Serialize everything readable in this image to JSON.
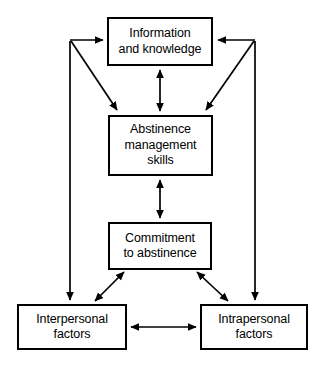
{
  "diagram": {
    "type": "flowchart",
    "title": "",
    "background_color": "#ffffff",
    "line_color": "#000000",
    "text_color": "#000000",
    "nodes": [
      {
        "id": "information",
        "label": "Information\nand knowledge",
        "line1": "Information",
        "line2": "and knowledge"
      },
      {
        "id": "abstinence",
        "label": "Abstinence\nmanagement\nskills",
        "line1": "Abstinence",
        "line2": "management",
        "line3": "skills"
      },
      {
        "id": "commitment",
        "label": "Commitment\nto abstinence",
        "line1": "Commitment",
        "line2": "to abstinence"
      },
      {
        "id": "interpersonal",
        "label": "Interpersonal\nfactors",
        "line1": "Interpersonal",
        "line2": "factors"
      },
      {
        "id": "intrapersonal",
        "label": "Intrapersonal\nfactors",
        "line1": "Intrapersonal",
        "line2": "factors"
      }
    ],
    "edges": [
      {
        "id": "information-abstinence",
        "from": "information",
        "to": "abstinence",
        "direction": "bidirectional",
        "style": "vertical"
      },
      {
        "id": "abstinence-commitment",
        "from": "abstinence",
        "to": "commitment",
        "direction": "bidirectional",
        "style": "vertical"
      },
      {
        "id": "commitment-interpersonal",
        "from": "commitment",
        "to": "interpersonal",
        "direction": "bidirectional",
        "style": "diagonal"
      },
      {
        "id": "commitment-intrapersonal",
        "from": "commitment",
        "to": "intrapersonal",
        "direction": "bidirectional",
        "style": "diagonal"
      },
      {
        "id": "interpersonal-intrapersonal",
        "from": "interpersonal",
        "to": "intrapersonal",
        "direction": "bidirectional",
        "style": "horizontal"
      },
      {
        "id": "left-branch-to-information",
        "from": "interpersonal",
        "to": "information",
        "direction": "unidirectional",
        "style": "elbow-left"
      },
      {
        "id": "left-branch-to-abstinence",
        "from": "interpersonal",
        "to": "abstinence",
        "direction": "unidirectional",
        "style": "diagonal-left"
      },
      {
        "id": "right-branch-to-information",
        "from": "intrapersonal",
        "to": "information",
        "direction": "unidirectional",
        "style": "elbow-right"
      },
      {
        "id": "right-branch-to-abstinence",
        "from": "intrapersonal",
        "to": "abstinence",
        "direction": "unidirectional",
        "style": "diagonal-right"
      }
    ]
  }
}
